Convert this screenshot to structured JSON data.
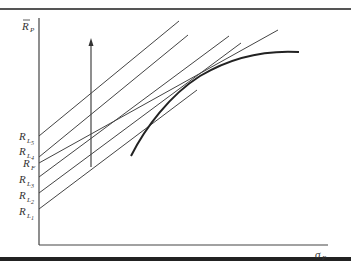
{
  "diagram": {
    "y_axis_label": {
      "main": "R",
      "accent": "bar",
      "sub": "P"
    },
    "x_axis_label": {
      "main": "σ",
      "sub": "P"
    },
    "intercept_labels": [
      {
        "id": "RL5",
        "main": "R",
        "sub": "L5",
        "sub_main": "L",
        "sub_index": "5"
      },
      {
        "id": "RL4",
        "main": "R",
        "sub": "L4",
        "sub_main": "L",
        "sub_index": "4"
      },
      {
        "id": "RF",
        "main": "R",
        "sub": "F",
        "sub_main": "F",
        "sub_index": ""
      },
      {
        "id": "RL3",
        "main": "R",
        "sub": "L3",
        "sub_main": "L",
        "sub_index": "3"
      },
      {
        "id": "RL2",
        "main": "R",
        "sub": "L2",
        "sub_main": "L",
        "sub_index": "2"
      },
      {
        "id": "RL1",
        "main": "R",
        "sub": "L1",
        "sub_main": "L",
        "sub_index": "1"
      }
    ],
    "elements": {
      "frontier": "efficient-frontier-curve",
      "arrow": "upward-shift-arrow",
      "lines": [
        "capital-market-line-L5",
        "capital-market-line-L4",
        "capital-market-line-F",
        "capital-market-line-L3",
        "capital-market-line-L2",
        "capital-market-line-L1"
      ]
    }
  }
}
